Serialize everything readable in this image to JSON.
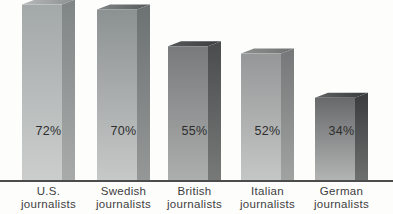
{
  "chart_data": {
    "type": "bar",
    "style": "3d-extruded-grayscale-bars",
    "title": "",
    "xlabel": "",
    "ylabel": "",
    "unit": "%",
    "grid": false,
    "legend": false,
    "ylim": [
      0,
      77
    ],
    "categories": [
      [
        "U.S.",
        "journalists"
      ],
      [
        "Swedish",
        "journalists"
      ],
      [
        "British",
        "journalists"
      ],
      [
        "Italian",
        "journalists"
      ],
      [
        "German",
        "journalists"
      ]
    ],
    "values": [
      72,
      70,
      55,
      52,
      34
    ],
    "value_labels": [
      "72%",
      "70%",
      "55%",
      "52%",
      "34%"
    ],
    "bar_shades": [
      {
        "front_top": "#a3a8a8",
        "front_bottom": "#cbcecd",
        "side_top": "#808585",
        "side_bottom": "#a8abaa",
        "top_left": "#b6baba",
        "top_right": "#8c9090"
      },
      {
        "front_top": "#8c9192",
        "front_bottom": "#c7c9c8",
        "side_top": "#6c7172",
        "side_bottom": "#959897",
        "top_left": "#808485",
        "top_right": "#565a5b"
      },
      {
        "front_top": "#787a7c",
        "front_bottom": "#adafae",
        "side_top": "#494b4d",
        "side_bottom": "#787a79",
        "top_left": "#56585a",
        "top_right": "#3b3d3f"
      },
      {
        "front_top": "#959798",
        "front_bottom": "#c5c7c6",
        "side_top": "#757778",
        "side_bottom": "#a1a3a2",
        "top_left": "#8f9191",
        "top_right": "#707272"
      },
      {
        "front_top": "#68696b",
        "front_bottom": "#b3b5b4",
        "side_top": "#3a3b3d",
        "side_bottom": "#6e706f",
        "top_left": "#616263",
        "top_right": "#393a3c"
      }
    ]
  },
  "colors": {
    "background": "#fdfdfc",
    "axis_line": "#4c4c4c",
    "value_label_text": "#2d2d2d",
    "category_label_text": "#3e3e3e"
  }
}
